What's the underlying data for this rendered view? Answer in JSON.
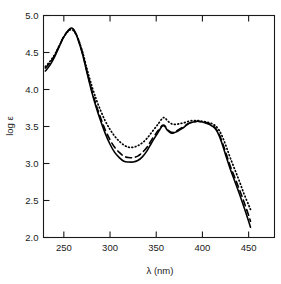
{
  "chart_data": {
    "type": "line",
    "title": "",
    "xlabel": "λ (nm)",
    "ylabel": "log ε",
    "xlim": [
      228,
      478
    ],
    "ylim": [
      2.0,
      5.0
    ],
    "grid": false,
    "legend": "none",
    "xticks": [
      250,
      300,
      350,
      400,
      450
    ],
    "xtick_labels": [
      "250",
      "300",
      "350",
      "400",
      "450"
    ],
    "yticks": [
      2.0,
      2.5,
      3.0,
      3.5,
      4.0,
      4.5,
      5.0
    ],
    "ytick_labels": [
      "2.0",
      "2.5",
      "3.0",
      "3.5",
      "4.0",
      "4.5",
      "5.0"
    ],
    "series": [
      {
        "name": "solid",
        "style": "solid",
        "color": "#000000",
        "x": [
          230,
          235,
          240,
          245,
          250,
          255,
          258,
          260,
          262,
          265,
          270,
          275,
          280,
          285,
          290,
          295,
          300,
          305,
          310,
          315,
          320,
          325,
          330,
          335,
          340,
          345,
          350,
          353,
          356,
          358,
          360,
          362,
          365,
          368,
          372,
          376,
          380,
          385,
          390,
          395,
          400,
          405,
          410,
          414,
          418,
          422,
          426,
          430,
          435,
          440,
          445,
          450,
          452
        ],
        "y": [
          4.25,
          4.33,
          4.44,
          4.58,
          4.71,
          4.8,
          4.83,
          4.82,
          4.78,
          4.69,
          4.49,
          4.23,
          3.98,
          3.76,
          3.57,
          3.4,
          3.26,
          3.15,
          3.08,
          3.03,
          3.02,
          3.02,
          3.04,
          3.09,
          3.17,
          3.28,
          3.38,
          3.44,
          3.5,
          3.51,
          3.49,
          3.45,
          3.42,
          3.41,
          3.43,
          3.46,
          3.49,
          3.54,
          3.56,
          3.57,
          3.56,
          3.54,
          3.51,
          3.47,
          3.38,
          3.24,
          3.08,
          2.93,
          2.76,
          2.59,
          2.41,
          2.22,
          2.14
        ]
      },
      {
        "name": "dashed",
        "style": "dashed",
        "color": "#000000",
        "x": [
          230,
          235,
          240,
          245,
          250,
          255,
          258,
          260,
          262,
          265,
          270,
          275,
          280,
          285,
          290,
          295,
          300,
          305,
          310,
          315,
          320,
          325,
          330,
          335,
          340,
          345,
          350,
          353,
          356,
          358,
          360,
          362,
          365,
          368,
          372,
          376,
          380,
          385,
          390,
          395,
          400,
          405,
          410,
          414,
          418,
          422,
          426,
          430,
          435,
          440,
          445,
          450,
          452
        ],
        "y": [
          4.29,
          4.36,
          4.46,
          4.59,
          4.72,
          4.8,
          4.82,
          4.81,
          4.78,
          4.7,
          4.5,
          4.25,
          4.0,
          3.79,
          3.61,
          3.45,
          3.32,
          3.22,
          3.15,
          3.1,
          3.08,
          3.08,
          3.1,
          3.15,
          3.22,
          3.32,
          3.41,
          3.46,
          3.51,
          3.52,
          3.5,
          3.46,
          3.43,
          3.42,
          3.44,
          3.47,
          3.5,
          3.54,
          3.56,
          3.57,
          3.56,
          3.55,
          3.52,
          3.48,
          3.4,
          3.27,
          3.12,
          2.97,
          2.81,
          2.65,
          2.48,
          2.3,
          2.22
        ]
      },
      {
        "name": "dotted",
        "style": "dotted",
        "color": "#000000",
        "x": [
          230,
          235,
          240,
          245,
          250,
          255,
          258,
          260,
          262,
          265,
          270,
          275,
          280,
          285,
          290,
          295,
          300,
          305,
          310,
          315,
          320,
          325,
          330,
          335,
          340,
          345,
          350,
          353,
          356,
          358,
          360,
          362,
          365,
          368,
          372,
          376,
          380,
          385,
          390,
          395,
          400,
          405,
          410,
          414,
          418,
          422,
          426,
          430,
          435,
          440,
          445,
          450,
          452
        ],
        "y": [
          4.31,
          4.38,
          4.47,
          4.59,
          4.71,
          4.79,
          4.81,
          4.8,
          4.77,
          4.7,
          4.52,
          4.28,
          4.06,
          3.87,
          3.71,
          3.57,
          3.46,
          3.37,
          3.3,
          3.25,
          3.22,
          3.22,
          3.24,
          3.28,
          3.34,
          3.42,
          3.5,
          3.55,
          3.6,
          3.62,
          3.61,
          3.58,
          3.55,
          3.53,
          3.53,
          3.54,
          3.55,
          3.57,
          3.58,
          3.58,
          3.57,
          3.56,
          3.54,
          3.51,
          3.45,
          3.35,
          3.22,
          3.08,
          2.92,
          2.76,
          2.59,
          2.44,
          2.38
        ]
      }
    ]
  },
  "axes": {
    "x_title": "λ (nm)",
    "y_title": "log ε"
  }
}
